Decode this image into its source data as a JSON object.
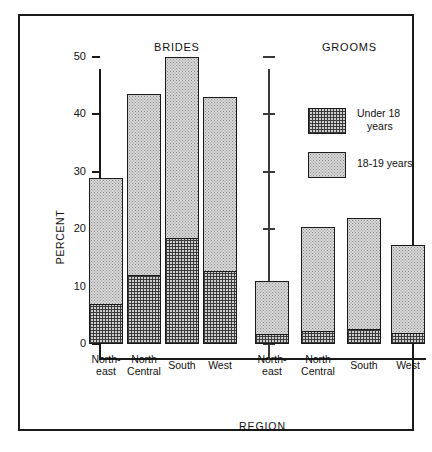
{
  "figure": {
    "group_titles": {
      "left": "BRIDES",
      "right": "GROOMS"
    },
    "axis": {
      "ylabel": "PERCENT",
      "xlabel": "REGION"
    }
  },
  "legend": {
    "items": [
      {
        "key": "under18",
        "label_line1": "Under 18",
        "label_line2": "years",
        "pattern": "cross-hatch-grid"
      },
      {
        "key": "age1819",
        "label_line1": "18-19 years",
        "label_line2": "",
        "pattern": "stipple-dots"
      }
    ]
  },
  "chart_data": {
    "type": "bar",
    "subtype": "stacked",
    "title": "",
    "xlabel": "REGION",
    "ylabel": "PERCENT",
    "ylim": [
      0,
      50
    ],
    "yticks": [
      0,
      10,
      20,
      30,
      40,
      50
    ],
    "ytick_labels": [
      "0",
      "10",
      "20",
      "30",
      "40",
      "50"
    ],
    "grid": false,
    "legend_position": "upper-right-inside",
    "panels": [
      {
        "name": "BRIDES",
        "categories": [
          "North-east",
          "North Central",
          "South",
          "West"
        ],
        "category_lines": [
          [
            "North-",
            "east"
          ],
          [
            "North",
            "Central"
          ],
          [
            "South",
            ""
          ],
          [
            "West",
            ""
          ]
        ],
        "series": [
          {
            "name": "Under 18 years",
            "values": [
              7.0,
              12.0,
              18.5,
              12.8
            ]
          },
          {
            "name": "18-19 years",
            "values": [
              22.0,
              31.5,
              31.5,
              30.2
            ]
          }
        ],
        "totals": [
          29.0,
          43.5,
          50.0,
          43.0
        ]
      },
      {
        "name": "GROOMS",
        "categories": [
          "North-east",
          "North Central",
          "South",
          "West"
        ],
        "category_lines": [
          [
            "North-",
            "east"
          ],
          [
            "North",
            "Central"
          ],
          [
            "South",
            ""
          ],
          [
            "West",
            ""
          ]
        ],
        "series": [
          {
            "name": "Under 18 years",
            "values": [
              1.7,
              2.2,
              2.7,
              2.0
            ]
          },
          {
            "name": "18-19 years",
            "values": [
              9.3,
              18.1,
              19.3,
              15.3
            ]
          }
        ],
        "totals": [
          11.0,
          20.3,
          22.0,
          17.3
        ]
      }
    ]
  },
  "colors": {
    "ink": "#1a1a1a",
    "fill_light": "#d8d8d8",
    "fill_hatch": "#cfcfcf",
    "paper": "#ffffff"
  }
}
